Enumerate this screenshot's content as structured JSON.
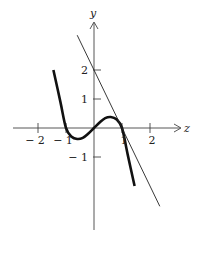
{
  "chart_data": {
    "type": "line",
    "title": "",
    "xlabel": "z",
    "ylabel": "y",
    "x_ticks": [
      -2,
      -1,
      1,
      2
    ],
    "x_tick_labels": [
      "− 2",
      "− 1",
      "1",
      "2"
    ],
    "y_ticks": [
      2,
      1,
      -1
    ],
    "y_tick_labels": [
      "2",
      "1",
      "− 1"
    ],
    "xlim": [
      -2.6,
      2.8
    ],
    "ylim": [
      -3.8,
      3.3
    ],
    "grid": false,
    "legend": null,
    "series": [
      {
        "name": "curve",
        "style": "thick",
        "description": "cubic-like curve with zeros at -1, 0, 1; local min near x=-0.6, local max near x=0.6",
        "x": [
          -1.45,
          -1.2,
          -1.0,
          -0.8,
          -0.6,
          -0.4,
          -0.2,
          0.0,
          0.2,
          0.4,
          0.6,
          0.8,
          1.0,
          1.2,
          1.45
        ],
        "y": [
          2.0,
          0.9,
          0.0,
          -0.3,
          -0.38,
          -0.34,
          -0.19,
          0.0,
          0.19,
          0.34,
          0.38,
          0.3,
          0.0,
          -0.9,
          -2.0
        ]
      },
      {
        "name": "tangent line",
        "style": "thin",
        "equation": "y = 2 - 2z",
        "x": [
          -0.6,
          2.35
        ],
        "y": [
          3.2,
          -2.7
        ]
      }
    ]
  }
}
